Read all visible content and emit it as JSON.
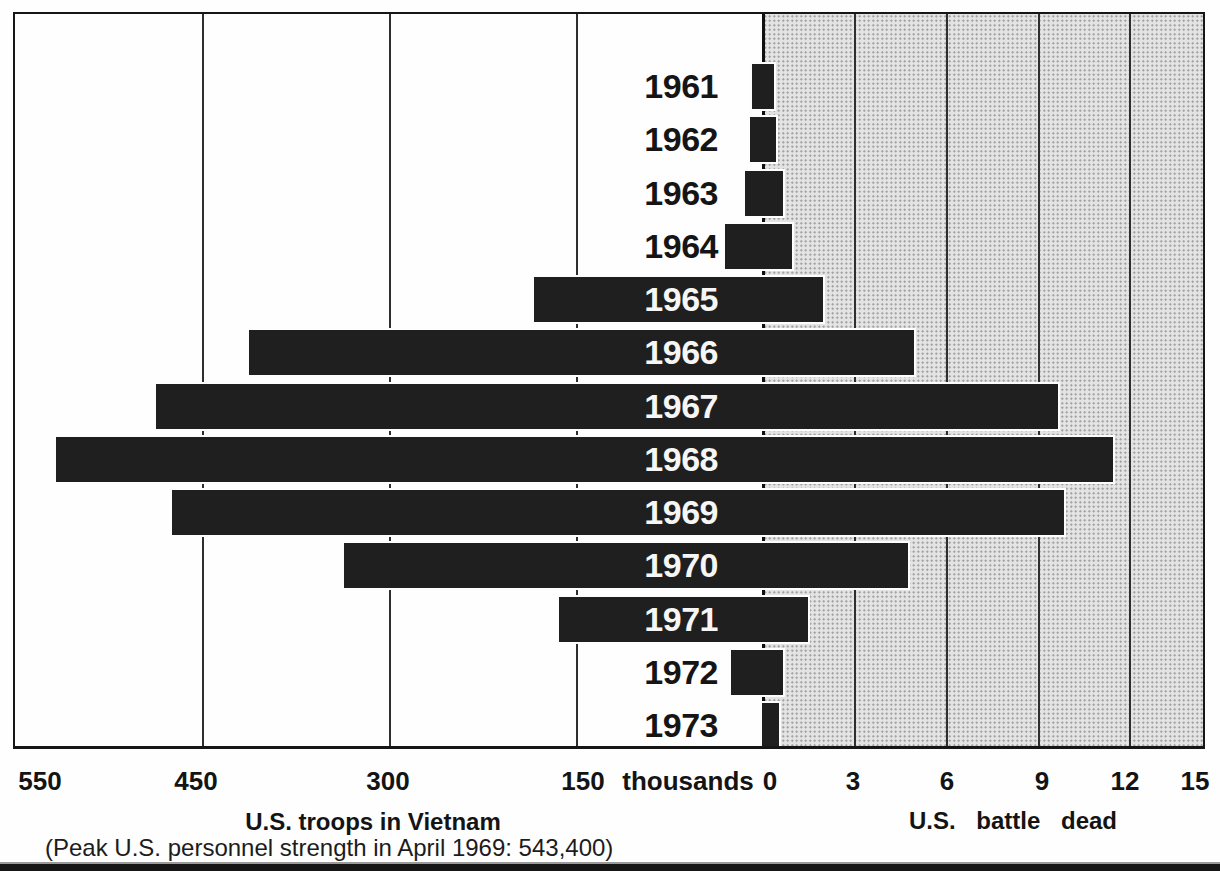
{
  "chart_data": {
    "type": "bar",
    "variant": "bilateral-horizontal",
    "years": [
      "1961",
      "1962",
      "1963",
      "1964",
      "1965",
      "1966",
      "1967",
      "1968",
      "1969",
      "1970",
      "1971",
      "1972",
      "1973"
    ],
    "series": [
      {
        "name": "U.S. troops in Vietnam",
        "side": "left",
        "unit": "thousands",
        "values": [
          8,
          10,
          14,
          30,
          183,
          411,
          486,
          566,
          473,
          335,
          163,
          25,
          0
        ]
      },
      {
        "name": "U.S. battle dead",
        "side": "right",
        "unit": "thousands",
        "values": [
          0.4,
          0.45,
          0.7,
          1.0,
          2.0,
          5.0,
          9.7,
          11.5,
          9.9,
          4.8,
          1.5,
          0.7,
          0.55
        ]
      }
    ],
    "left_title": "U.S. troops in Vietnam",
    "left_subtitle": "(Peak U.S. personnel strength in April 1969: 543,400)",
    "right_title": "U.S. battle dead",
    "left_axis": {
      "unit_label": "thousands",
      "ticks": [
        {
          "label": "550",
          "x": 40
        },
        {
          "label": "450",
          "x": 196
        },
        {
          "label": "300",
          "x": 388
        },
        {
          "label": "150",
          "x": 583
        },
        {
          "label": "thousands",
          "x": 688
        },
        {
          "label": "0",
          "x": 770
        }
      ],
      "gridlines_x": [
        202,
        389,
        576
      ],
      "range": [
        0,
        600
      ]
    },
    "right_axis": {
      "ticks": [
        {
          "label": "3",
          "x": 853
        },
        {
          "label": "6",
          "x": 947
        },
        {
          "label": "9",
          "x": 1042
        },
        {
          "label": "12",
          "x": 1125
        },
        {
          "label": "15",
          "x": 1195
        }
      ],
      "gridlines_x": [
        854,
        946,
        1038,
        1129
      ],
      "range": [
        0,
        15
      ]
    },
    "colors": {
      "bar": "#1f1f1f",
      "stipple_background": "#e4e4e4",
      "frame": "#161616",
      "label_on_bar": "#f6f6f6",
      "label_on_white": "#151515"
    },
    "layout_px": {
      "zero_x": 762,
      "px_per_thousand_troops": 1.247,
      "px_per_thousand_dead": 30.5,
      "row_top0": 64,
      "row_pitch": 53.25,
      "row_height": 45,
      "year_label_right_edge": 718
    }
  }
}
